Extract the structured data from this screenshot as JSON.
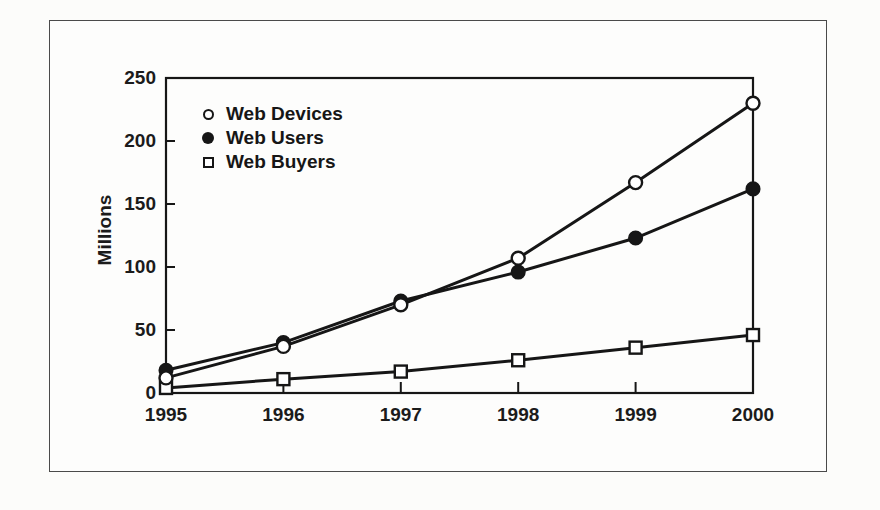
{
  "figure": {
    "background_color": "#fcfcfa",
    "border_color": "#4a4a4a",
    "ink_color": "#161616"
  },
  "chart_data": {
    "type": "line",
    "title": "",
    "xlabel": "",
    "ylabel": "Millions",
    "categories": [
      "1995",
      "1996",
      "1997",
      "1998",
      "1999",
      "2000"
    ],
    "y_ticks": [
      0,
      50,
      100,
      150,
      200,
      250
    ],
    "ylim": [
      0,
      250
    ],
    "grid": false,
    "legend_position": "top-left-inside",
    "series": [
      {
        "name": "Web Devices",
        "marker": "open-circle",
        "values": [
          12,
          37,
          70,
          107,
          167,
          230
        ]
      },
      {
        "name": "Web Users",
        "marker": "filled-circle",
        "values": [
          18,
          40,
          73,
          96,
          123,
          162
        ]
      },
      {
        "name": "Web Buyers",
        "marker": "open-square",
        "values": [
          4,
          11,
          17,
          26,
          36,
          46
        ]
      }
    ]
  }
}
